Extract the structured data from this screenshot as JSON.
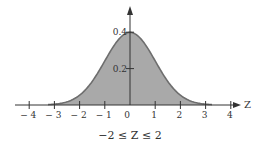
{
  "chart_data": {
    "type": "area",
    "title": "",
    "caption": "−2 ≤ Z ≤ 2",
    "xlabel": "Z",
    "ylabel": "",
    "distribution": "standard normal density",
    "x_ticks": [
      -4,
      -3,
      -2,
      -1,
      0,
      1,
      2,
      3,
      4
    ],
    "x_tick_labels": [
      "− 4",
      "− 3",
      "− 2",
      "− 1",
      "0",
      "1",
      "2",
      "3",
      "4"
    ],
    "y_ticks": [
      0.2,
      0.4
    ],
    "y_tick_labels": [
      "0.2",
      "0.4"
    ],
    "xlim": [
      -4.3,
      4.4
    ],
    "ylim": [
      0,
      0.5
    ],
    "shaded_region": [
      -3.25,
      3.25
    ],
    "x": [
      -3.25,
      -3,
      -2.5,
      -2,
      -1.5,
      -1,
      -0.5,
      0,
      0.5,
      1,
      1.5,
      2,
      2.5,
      3,
      3.25
    ],
    "values": [
      0.002,
      0.004,
      0.018,
      0.054,
      0.13,
      0.242,
      0.352,
      0.399,
      0.352,
      0.242,
      0.13,
      0.054,
      0.018,
      0.004,
      0.002
    ],
    "grid": false,
    "legend": null,
    "colors": {
      "fill": "#a9a9a9",
      "curve": "#6e6e6e",
      "axis": "#333333"
    }
  }
}
